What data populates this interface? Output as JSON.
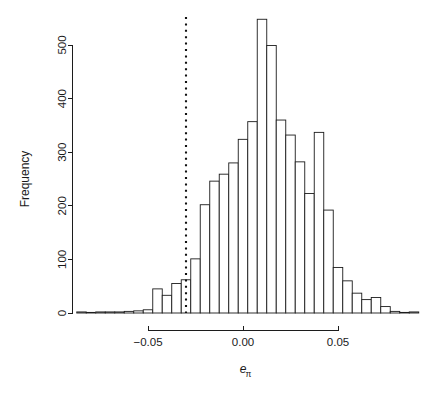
{
  "figure": {
    "background_color": "#ffffff",
    "foreground_color": "#1c1c1c",
    "width": 423,
    "height": 394
  },
  "chart_data": {
    "type": "bar",
    "chart_subtype": "histogram",
    "title": "",
    "subtitle": "",
    "xlabel": "e_pi",
    "xlabel_base": "e",
    "xlabel_subscript": "π",
    "ylabel": "Frequency",
    "grid": false,
    "legend": false,
    "legend_position": "none",
    "bin_width": 0.005,
    "xlim": [
      -0.0875,
      0.0925
    ],
    "ylim": [
      0,
      548
    ],
    "xticks": [
      -0.05,
      0.0,
      0.05
    ],
    "xtick_labels": [
      "−0.05",
      "0.00",
      "0.05"
    ],
    "yticks": [
      0,
      100,
      200,
      300,
      400,
      500
    ],
    "ytick_labels": [
      "0",
      "100",
      "200",
      "300",
      "400",
      "500"
    ],
    "x_axis_range_drawn": [
      -0.05,
      0.05
    ],
    "y_axis_range_drawn": [
      0,
      500
    ],
    "bin_edges": [
      -0.0875,
      -0.0825,
      -0.0775,
      -0.0725,
      -0.0675,
      -0.0625,
      -0.0575,
      -0.0525,
      -0.0475,
      -0.0425,
      -0.0375,
      -0.0325,
      -0.0275,
      -0.0225,
      -0.0175,
      -0.0125,
      -0.0075,
      -0.0025,
      0.0025,
      0.0075,
      0.0125,
      0.0175,
      0.0225,
      0.0275,
      0.0325,
      0.0375,
      0.0425,
      0.0475,
      0.0525,
      0.0575,
      0.0625,
      0.0675,
      0.0725,
      0.0775,
      0.0825,
      0.0875,
      0.0925
    ],
    "bin_centers": [
      -0.085,
      -0.08,
      -0.075,
      -0.07,
      -0.065,
      -0.06,
      -0.055,
      -0.05,
      -0.045,
      -0.04,
      -0.035,
      -0.03,
      -0.025,
      -0.02,
      -0.015,
      -0.01,
      -0.005,
      0.0,
      0.005,
      0.01,
      0.015,
      0.02,
      0.025,
      0.03,
      0.035,
      0.04,
      0.045,
      0.05,
      0.055,
      0.06,
      0.065,
      0.07,
      0.075,
      0.08,
      0.085,
      0.09
    ],
    "values": [
      2,
      1,
      2,
      2,
      2,
      3,
      4,
      6,
      45,
      33,
      55,
      62,
      101,
      202,
      246,
      259,
      280,
      324,
      357,
      548,
      499,
      360,
      332,
      282,
      223,
      337,
      192,
      85,
      60,
      37,
      25,
      29,
      12,
      3,
      1,
      2
    ],
    "annotations": [
      {
        "name": "reference-line",
        "type": "vertical-dotted-line",
        "x": -0.03,
        "style": "dotted",
        "color": "#111111"
      }
    ]
  }
}
